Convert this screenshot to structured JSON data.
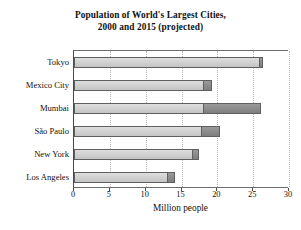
{
  "chart_data": {
    "type": "bar",
    "orientation": "horizontal",
    "stacked_overlay": true,
    "title": "Population of World's Largest Cities, 2000 and 2015 (projected)",
    "title_lines": [
      "Population of World's Largest Cities,",
      "2000 and 2015 (projected)"
    ],
    "xlabel": "Million people",
    "ylabel": "",
    "categories": [
      "Tokyo",
      "Mexico City",
      "Mumbai",
      "São Paulo",
      "New York",
      "Los Angeles"
    ],
    "series": [
      {
        "name": "2000",
        "values": [
          26.0,
          18.1,
          18.1,
          17.8,
          16.6,
          13.1
        ],
        "color": "#d2d2d2"
      },
      {
        "name": "2015 (projected)",
        "values": [
          26.4,
          19.2,
          26.1,
          20.4,
          17.4,
          14.1
        ],
        "color": "#8d8d8d"
      }
    ],
    "xlim": [
      0,
      30
    ],
    "xticks": [
      0,
      5,
      10,
      15,
      20,
      25,
      30
    ],
    "xtick_labels": [
      "0",
      "5",
      "10",
      "15",
      "20",
      "25",
      "30"
    ],
    "grid": "vertical-dotted",
    "legend": "none"
  },
  "style": {
    "bar_color_2000": "#d2d2d2",
    "bar_color_2015": "#8d8d8d",
    "bar_border": "#5f5f5f",
    "axis_color": "#4a4a4a",
    "grid_color": "#b9b9b9",
    "background": "#ffffff",
    "text_color": "#111111"
  }
}
